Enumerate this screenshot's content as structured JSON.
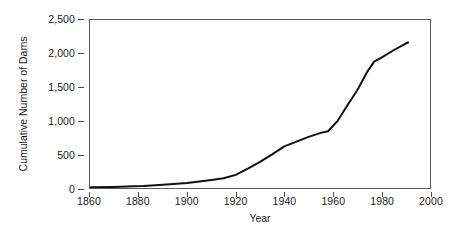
{
  "chart_data": {
    "type": "line",
    "title": "",
    "xlabel": "Year",
    "ylabel": "Cumulative Number of Dams",
    "xlim": [
      1860,
      2000
    ],
    "ylim": [
      0,
      2500
    ],
    "grid": false,
    "legend": null,
    "x_ticks": [
      1860,
      1880,
      1900,
      1920,
      1940,
      1960,
      1980,
      2000
    ],
    "x_tick_labels": [
      "1860",
      "1880",
      "1900",
      "1920",
      "1940",
      "1960",
      "1980",
      "2000"
    ],
    "y_ticks": [
      0,
      500,
      1000,
      1500,
      2000,
      2500
    ],
    "y_tick_labels": [
      "0",
      "500",
      "1,000",
      "1,500",
      "2,000",
      "2,500"
    ],
    "line_color": "#111111",
    "line_width": 2.0,
    "series": [
      {
        "name": "Cumulative Number of Dams",
        "x": [
          1860,
          1870,
          1878,
          1882,
          1890,
          1900,
          1910,
          1915,
          1920,
          1925,
          1930,
          1935,
          1940,
          1945,
          1950,
          1955,
          1958,
          1962,
          1966,
          1970,
          1974,
          1977,
          1980,
          1985,
          1990,
          1991
        ],
        "values": [
          10,
          15,
          25,
          30,
          50,
          75,
          120,
          145,
          195,
          290,
          390,
          500,
          620,
          690,
          760,
          820,
          845,
          1000,
          1230,
          1450,
          1720,
          1880,
          1940,
          2050,
          2150,
          2165
        ]
      }
    ]
  },
  "axes": {
    "y_title": "Cumulative Number of Dams",
    "x_title": "Year"
  }
}
